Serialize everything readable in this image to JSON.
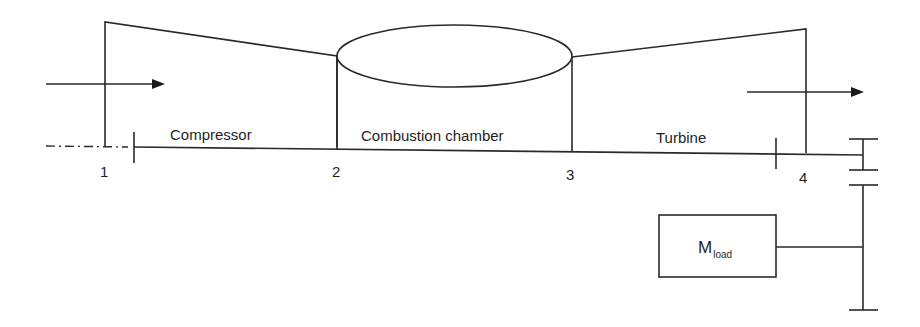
{
  "diagram": {
    "type": "gas turbine schematic",
    "components": {
      "compressor": {
        "label": "Compressor"
      },
      "combustion_chamber": {
        "label": "Combustion chamber"
      },
      "turbine": {
        "label": "Turbine"
      },
      "load": {
        "label_main": "M",
        "label_sub": "load"
      }
    },
    "stations": [
      {
        "id": "1",
        "label": "1"
      },
      {
        "id": "2",
        "label": "2"
      },
      {
        "id": "3",
        "label": "3"
      },
      {
        "id": "4",
        "label": "4"
      }
    ],
    "flows": {
      "inlet": "inlet-flow-arrow",
      "exhaust": "exhaust-flow-arrow"
    },
    "colors": {
      "line": "#2a2a2a",
      "text": "#1f1f1f",
      "background": "#ffffff"
    }
  }
}
